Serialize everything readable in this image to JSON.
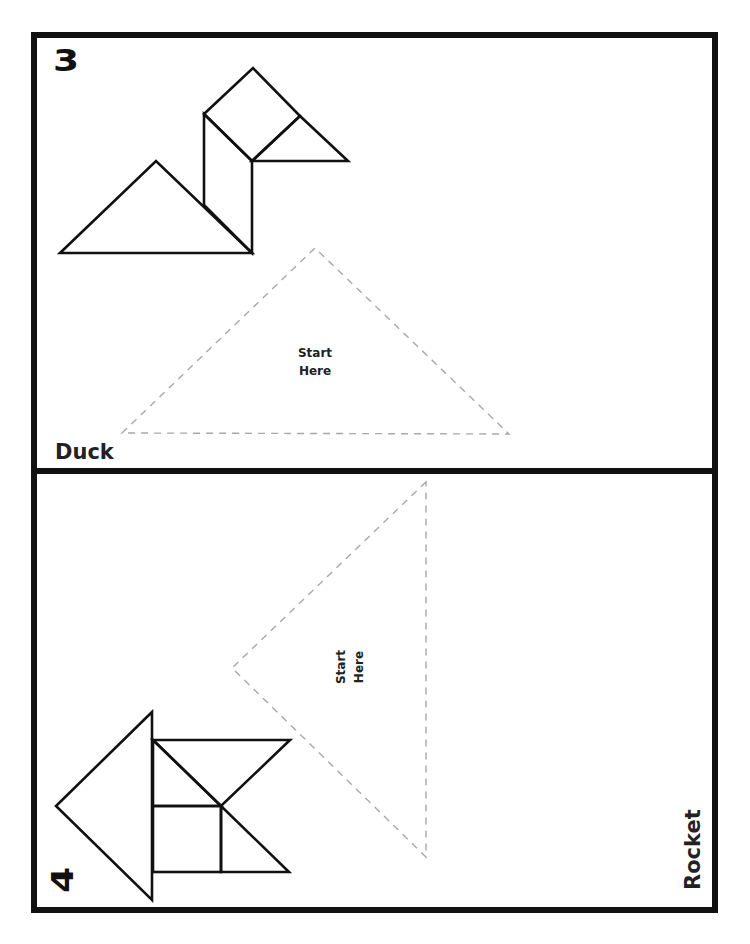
{
  "page": {
    "colors": {
      "outline": "#111111",
      "dash": "#a8a8a8",
      "background": "#ffffff"
    }
  },
  "puzzles": [
    {
      "number": "3",
      "name": "Duck",
      "start_label_line1": "Start",
      "start_label_line2": "Here",
      "pieces": [
        "large-triangle",
        "parallelogram",
        "square",
        "small-triangle"
      ]
    },
    {
      "number": "4",
      "name": "Rocket",
      "start_label_line1": "Start",
      "start_label_line2": "Here",
      "pieces": [
        "large-triangle",
        "parallelogram",
        "square",
        "small-triangle",
        "small-triangle"
      ]
    }
  ]
}
